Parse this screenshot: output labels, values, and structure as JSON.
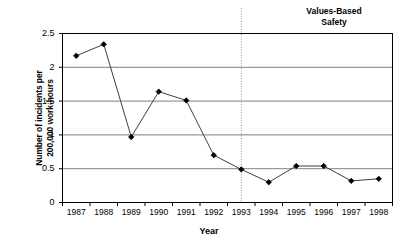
{
  "chart_data": {
    "type": "line",
    "title": "",
    "xlabel": "Year",
    "ylabel": "Number of incidents per 200,000 work-hours",
    "ylabel_lines": [
      "Number of incidents per",
      "200,000 work-hours"
    ],
    "categories": [
      "1987",
      "1988",
      "1989",
      "1990",
      "1991",
      "1992",
      "1993",
      "1994",
      "1995",
      "1996",
      "1997",
      "1998"
    ],
    "values": [
      2.17,
      2.34,
      0.97,
      1.64,
      1.51,
      0.7,
      0.49,
      0.3,
      0.54,
      0.54,
      0.32,
      0.35
    ],
    "series": [
      {
        "name": "Incident rate",
        "values": [
          2.17,
          2.34,
          0.97,
          1.64,
          1.51,
          0.7,
          0.49,
          0.3,
          0.54,
          0.54,
          0.32,
          0.35
        ]
      }
    ],
    "ylim": [
      0,
      2.5
    ],
    "yticks": [
      0,
      0.5,
      1,
      1.5,
      2,
      2.5
    ],
    "ytick_labels": [
      "0",
      "0.5",
      "1",
      "1.5",
      "2",
      "2.5"
    ],
    "grid": "horizontal",
    "legend": "none",
    "line_color": "#3f3f3f",
    "marker_color": "#000000",
    "grid_color": "#808080",
    "axis_color": "#000000",
    "annotations": [
      {
        "text": "Values-Based Safety",
        "lines": [
          "Values-Based",
          "Safety"
        ],
        "marker_type": "vertical-dotted-line",
        "marker_between": [
          "1993",
          "1994"
        ],
        "marker_x_value": 6.5
      }
    ]
  }
}
